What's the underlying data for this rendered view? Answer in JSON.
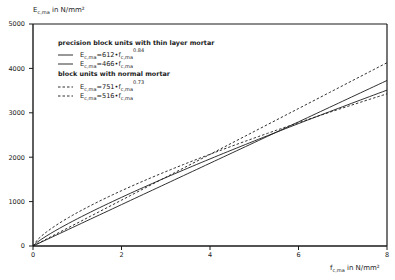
{
  "chart_data": {
    "type": "line",
    "title": "",
    "xlabel": "f_c,ma in N/mm²",
    "ylabel": "E_c,ma in N/mm²",
    "xlabel_parts": {
      "base": "f",
      "sub": "c,ma",
      "unit": " in N/mm²"
    },
    "ylabel_parts": {
      "base": "E",
      "sub": "c,ma",
      "unit": " in N/mm²"
    },
    "xlim": [
      0,
      8
    ],
    "ylim": [
      0,
      5000
    ],
    "x_ticks": [
      0,
      2,
      4,
      6,
      8
    ],
    "y_ticks": [
      0,
      1000,
      2000,
      3000,
      4000,
      5000
    ],
    "grid": false,
    "legend_position": "upper-left",
    "legend_groups": [
      {
        "heading": "precision block units with thin layer mortar",
        "entries": [
          {
            "label": "E_c,ma=612•f_c,ma^0.84",
            "style": "solid",
            "coef": 612,
            "exp": 0.84,
            "coef_text": "=612•f",
            "sup": "0.84"
          },
          {
            "label": "E_c,ma=466•f_c,ma",
            "style": "solid",
            "coef": 466,
            "exp": 1.0,
            "coef_text": "=466•f",
            "sup": ""
          }
        ]
      },
      {
        "heading": "block units with normal mortar",
        "entries": [
          {
            "label": "E_c,ma=751•f_c,ma^0.73",
            "style": "dashed",
            "coef": 751,
            "exp": 0.73,
            "coef_text": "=751•f",
            "sup": "0.73"
          },
          {
            "label": "E_c,ma=516•f_c,ma",
            "style": "dashed",
            "coef": 516,
            "exp": 1.0,
            "coef_text": "=516•f",
            "sup": ""
          }
        ]
      }
    ],
    "x": [
      0,
      0.5,
      1,
      2,
      3,
      4,
      5,
      6,
      7,
      8
    ],
    "series": [
      {
        "name": "E_c,ma=612•f_c,ma^0.84",
        "style": "solid",
        "values": [
          0,
          343,
          612,
          1093,
          1534,
          1951,
          2349,
          2734,
          3107,
          3485
        ]
      },
      {
        "name": "E_c,ma=466•f_c,ma",
        "style": "solid",
        "values": [
          0,
          233,
          466,
          932,
          1398,
          1864,
          2330,
          2796,
          3262,
          3728
        ]
      },
      {
        "name": "E_c,ma=751•f_c,ma^0.73",
        "style": "dashed",
        "values": [
          0,
          453,
          751,
          1245,
          1668,
          2064,
          2431,
          2781,
          3114,
          3422
        ]
      },
      {
        "name": "E_c,ma=516•f_c,ma",
        "style": "dashed",
        "values": [
          0,
          258,
          516,
          1032,
          1548,
          2064,
          2580,
          3096,
          3612,
          4128
        ]
      }
    ]
  },
  "labels": {
    "sub": "c,ma",
    "e": "E",
    "f": "f"
  }
}
